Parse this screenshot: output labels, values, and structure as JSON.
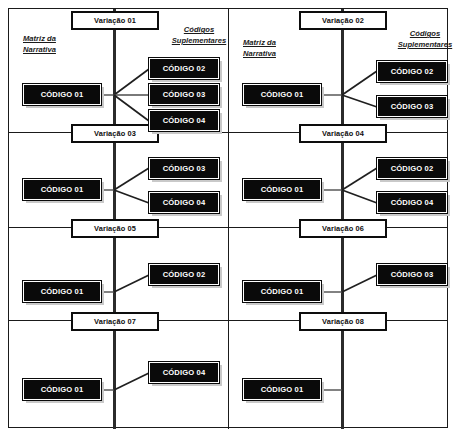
{
  "diagram": {
    "column_headers": {
      "left": "Matriz da\nNarrativa",
      "left_line1": "Matriz da",
      "left_line2": "Narrativa",
      "right": "Códigos\nSuplementares",
      "right_line1": "Códigos",
      "right_line2": "Suplementares"
    },
    "colors": {
      "box_fill": "#0a0a0a",
      "box_text": "#ffffff",
      "border": "#1a1a1a",
      "shadow": "#c9c9c9",
      "connector": "#4d4d4d",
      "background": "#ffffff"
    },
    "panels": [
      {
        "id": "variacao-01",
        "label": "Variação 01",
        "main_code": "CÓDIGO 01",
        "supplementary_codes": [
          "CÓDIGO 02",
          "CÓDIGO 03",
          "CÓDIGO 04"
        ],
        "supplementary_count": 3
      },
      {
        "id": "variacao-02",
        "label": "Variação 02",
        "main_code": "CÓDIGO 01",
        "supplementary_codes": [
          "CÓDIGO 02",
          "CÓDIGO 03"
        ],
        "supplementary_count": 2
      },
      {
        "id": "variacao-03",
        "label": "Variação 03",
        "main_code": "CÓDIGO 01",
        "supplementary_codes": [
          "CÓDIGO 03",
          "CÓDIGO 04"
        ],
        "supplementary_count": 2
      },
      {
        "id": "variacao-04",
        "label": "Variação 04",
        "main_code": "CÓDIGO 01",
        "supplementary_codes": [
          "CÓDIGO 02",
          "CÓDIGO 04"
        ],
        "supplementary_count": 2
      },
      {
        "id": "variacao-05",
        "label": "Variação 05",
        "main_code": "CÓDIGO 01",
        "supplementary_codes": [
          "CÓDIGO 02"
        ],
        "supplementary_count": 1
      },
      {
        "id": "variacao-06",
        "label": "Variação 06",
        "main_code": "CÓDIGO 01",
        "supplementary_codes": [
          "CÓDIGO 03"
        ],
        "supplementary_count": 1
      },
      {
        "id": "variacao-07",
        "label": "Variação 07",
        "main_code": "CÓDIGO 01",
        "supplementary_codes": [
          "CÓDIGO 04"
        ],
        "supplementary_count": 1
      },
      {
        "id": "variacao-08",
        "label": "Variação 08",
        "main_code": "CÓDIGO 01",
        "supplementary_codes": [],
        "supplementary_count": 0
      }
    ]
  }
}
